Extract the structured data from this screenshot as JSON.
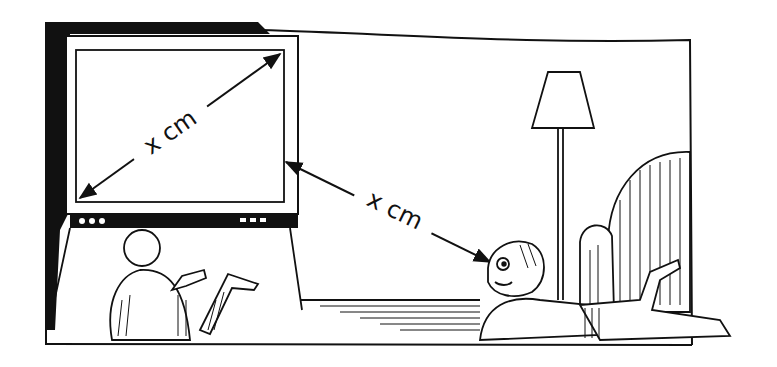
{
  "illustration": {
    "description": "Line drawing: viewing distance to a TV equals its screen diagonal",
    "tv_diagonal_label": "x cm",
    "viewing_distance_label": "x cm",
    "colors": {
      "ink": "#111111",
      "paper": "#ffffff"
    },
    "objects": [
      "room-wall",
      "tv",
      "child-near-tv",
      "child-viewer",
      "floor-lamp",
      "armchair",
      "rug"
    ]
  }
}
